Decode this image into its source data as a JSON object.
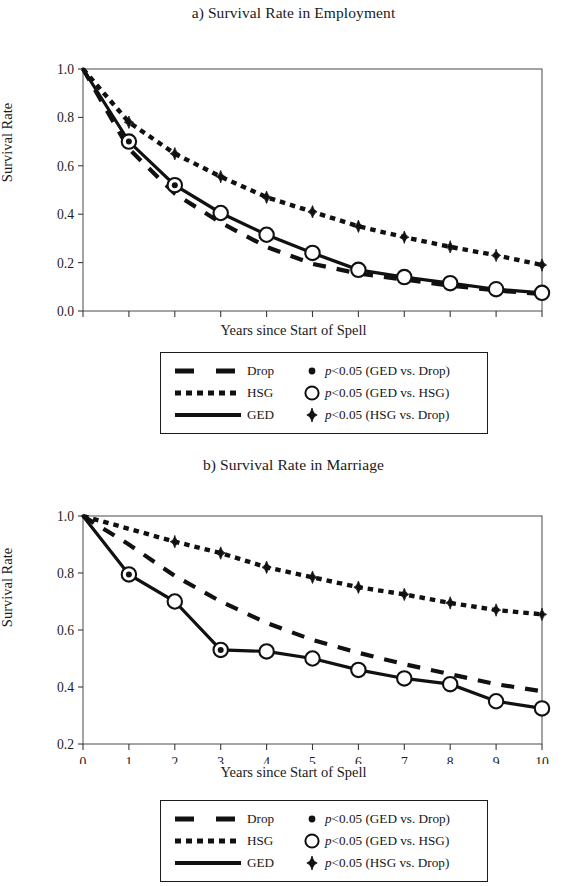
{
  "figure": {
    "axis_label_x": "Years since Start of Spell",
    "axis_label_y": "Survival Rate"
  },
  "legend": {
    "rows": [
      {
        "line_style": "dashed",
        "series_label": "Drop",
        "marker": "small-dot",
        "p_prefix": "p",
        "p_text": "<0.05 (GED vs. Drop)"
      },
      {
        "line_style": "dotted",
        "series_label": "HSG",
        "marker": "open-circle",
        "p_prefix": "p",
        "p_text": "<0.05 (GED vs. HSG)"
      },
      {
        "line_style": "solid",
        "series_label": "GED",
        "marker": "filled-diamond",
        "p_prefix": "p",
        "p_text": "<0.05 (HSG vs. Drop)"
      }
    ]
  },
  "chart_data": [
    {
      "type": "line",
      "panel": "a",
      "title": "a) Survival Rate in Employment",
      "xlabel": "Years since Start of Spell",
      "ylabel": "Survival Rate",
      "x": [
        0,
        1,
        2,
        3,
        4,
        5,
        6,
        7,
        8,
        9,
        10
      ],
      "xticklabels": [
        "0",
        "1",
        "2",
        "3",
        "4",
        "5",
        "6",
        "7",
        "8",
        "9",
        "10"
      ],
      "yticks": [
        0.0,
        0.2,
        0.4,
        0.6,
        0.8,
        1.0
      ],
      "yticklabels": [
        "0.0",
        "0.2",
        "0.4",
        "0.6",
        "0.8",
        "1.0"
      ],
      "xlim": [
        0,
        10
      ],
      "ylim": [
        0.0,
        1.0
      ],
      "grid": false,
      "legend_position": "below-plot",
      "series": [
        {
          "name": "Drop",
          "style": "dashed",
          "values": [
            1.0,
            0.67,
            0.485,
            0.365,
            0.265,
            0.195,
            0.155,
            0.13,
            0.105,
            0.085,
            0.07
          ]
        },
        {
          "name": "HSG",
          "style": "dotted",
          "values": [
            1.0,
            0.78,
            0.65,
            0.555,
            0.47,
            0.41,
            0.35,
            0.305,
            0.265,
            0.23,
            0.19
          ]
        },
        {
          "name": "GED",
          "style": "solid",
          "values": [
            1.0,
            0.7,
            0.52,
            0.405,
            0.315,
            0.24,
            0.17,
            0.14,
            0.115,
            0.09,
            0.075
          ]
        }
      ],
      "markers": {
        "ged_vs_drop_small_dot_at_x": [
          1,
          2
        ],
        "ged_vs_hsg_open_circle_at_x": [
          1,
          2,
          3,
          4,
          5,
          6,
          7,
          8,
          9,
          10
        ],
        "hsg_vs_drop_diamond_at_x": [
          1,
          2,
          3,
          4,
          5,
          6,
          7,
          8,
          9,
          10
        ]
      }
    },
    {
      "type": "line",
      "panel": "b",
      "title": "b) Survival Rate in Marriage",
      "xlabel": "Years since Start of Spell",
      "ylabel": "Survival Rate",
      "x": [
        0,
        1,
        2,
        3,
        4,
        5,
        6,
        7,
        8,
        9,
        10
      ],
      "xticklabels": [
        "0",
        "1",
        "2",
        "3",
        "4",
        "5",
        "6",
        "7",
        "8",
        "9",
        "10"
      ],
      "yticks": [
        0.2,
        0.4,
        0.6,
        0.8,
        1.0
      ],
      "yticklabels": [
        "0.2",
        "0.4",
        "0.6",
        "0.8",
        "1.0"
      ],
      "xlim": [
        0,
        10
      ],
      "ylim": [
        0.2,
        1.0
      ],
      "grid": false,
      "legend_position": "below-plot",
      "series": [
        {
          "name": "Drop",
          "style": "dashed",
          "values": [
            1.0,
            0.9,
            0.79,
            0.7,
            0.625,
            0.565,
            0.52,
            0.48,
            0.445,
            0.41,
            0.385
          ]
        },
        {
          "name": "HSG",
          "style": "dotted",
          "values": [
            1.0,
            0.955,
            0.91,
            0.87,
            0.82,
            0.785,
            0.75,
            0.725,
            0.695,
            0.67,
            0.655
          ]
        },
        {
          "name": "GED",
          "style": "solid",
          "values": [
            1.0,
            0.795,
            0.7,
            0.53,
            0.525,
            0.5,
            0.46,
            0.43,
            0.41,
            0.35,
            0.325
          ]
        }
      ],
      "markers": {
        "ged_vs_drop_small_dot_at_x": [
          1,
          3
        ],
        "ged_vs_hsg_open_circle_at_x": [
          1,
          2,
          3,
          4,
          5,
          6,
          7,
          8,
          9,
          10
        ],
        "hsg_vs_drop_diamond_at_x": [
          2,
          3,
          4,
          5,
          6,
          7,
          8,
          9,
          10
        ]
      }
    }
  ]
}
